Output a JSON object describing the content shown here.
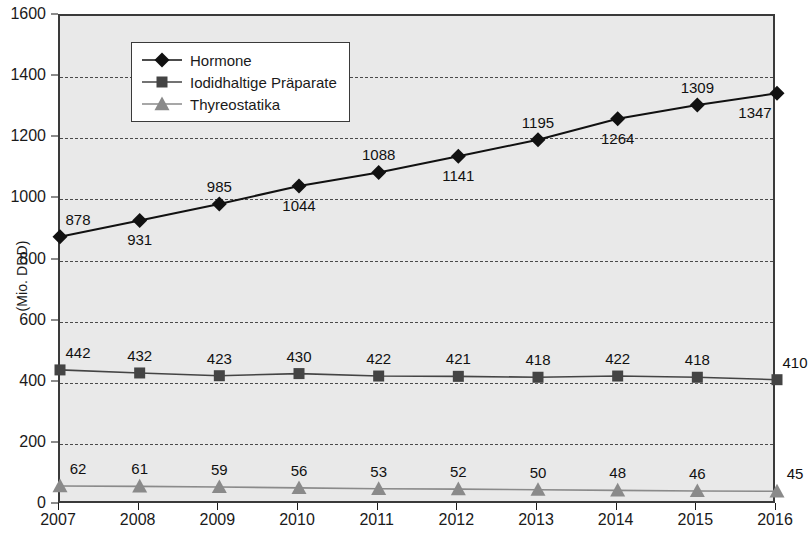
{
  "chart_data": {
    "type": "line",
    "title": "",
    "xlabel": "",
    "ylabel": "(Mio. DDD)",
    "categories": [
      "2007",
      "2008",
      "2009",
      "2010",
      "2011",
      "2012",
      "2013",
      "2014",
      "2015",
      "2016"
    ],
    "ylim": [
      0,
      1600
    ],
    "ytick_step": 200,
    "yticks": [
      0,
      200,
      400,
      600,
      800,
      1000,
      1200,
      1400,
      1600
    ],
    "grid": "horizontal-dashed",
    "legend_position": "top-left",
    "series": [
      {
        "name": "Hormone",
        "color": "#111111",
        "marker": "diamond",
        "values": [
          878,
          931,
          985,
          1044,
          1088,
          1141,
          1195,
          1264,
          1309,
          1347
        ],
        "label_positions": [
          "above-left",
          "below",
          "above",
          "below",
          "above",
          "below",
          "above",
          "below",
          "above",
          "below-left"
        ]
      },
      {
        "name": "Iodidhaltige Präparate",
        "color": "#444444",
        "marker": "square",
        "values": [
          442,
          432,
          423,
          430,
          422,
          421,
          418,
          422,
          418,
          410
        ],
        "label_positions": [
          "above-left",
          "above",
          "above",
          "above",
          "above",
          "above",
          "above",
          "above",
          "above",
          "above-left"
        ]
      },
      {
        "name": "Thyreostatika",
        "color": "#8a8a8a",
        "marker": "triangle",
        "values": [
          62,
          61,
          59,
          56,
          53,
          52,
          50,
          48,
          46,
          45
        ],
        "label_positions": [
          "above-left",
          "above",
          "above",
          "above",
          "above",
          "above",
          "above",
          "above",
          "above",
          "above-left"
        ]
      }
    ]
  },
  "style": {
    "plot_background": "#e9e9e9",
    "plot_border": "#3a3a3a",
    "grid_color": "#4a4a4a",
    "page_background": "#ffffff",
    "legend_background": "#ffffff"
  }
}
